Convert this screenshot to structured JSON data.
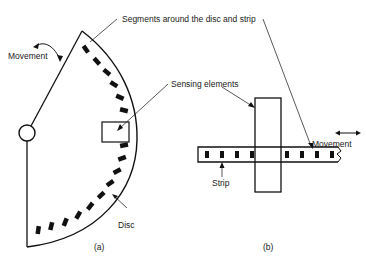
{
  "labels": {
    "segments": "Segments around the disc and strip",
    "movement_a": "Movement",
    "sensing": "Sensing elements",
    "disc": "Disc",
    "strip": "Strip",
    "movement_b": "Movement",
    "caption_a": "(a)",
    "caption_b": "(b)"
  },
  "colors": {
    "ink": "#111111",
    "background": "#ffffff"
  }
}
